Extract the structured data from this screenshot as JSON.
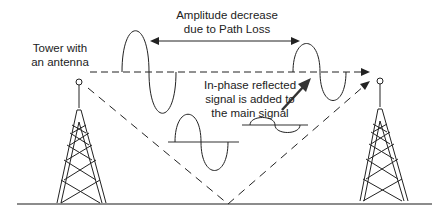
{
  "labels": {
    "amplitude_line1": "Amplitude decrease",
    "amplitude_line2": "due to Path Loss",
    "tower_line1": "Tower with",
    "tower_line2": "an antenna",
    "reflected_line1": "In-phase reflected",
    "reflected_line2": "signal is added to",
    "reflected_line3": "the main signal"
  },
  "colors": {
    "stroke": "#222222",
    "ground": "#555555",
    "background": "#ffffff"
  },
  "elements": {
    "left_tower": "transmitter-tower",
    "right_tower": "receiver-tower",
    "direct_path": "dashed-line-of-sight",
    "reflected_path": "dashed-ground-reflection",
    "waves": [
      "large-direct-wave",
      "attenuated-direct-wave",
      "reflected-wave-medium",
      "reflected-wave-small"
    ]
  }
}
